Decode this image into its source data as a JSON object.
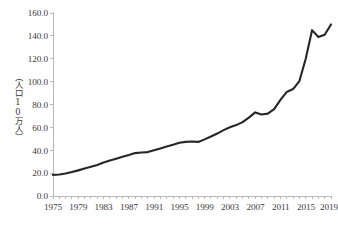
{
  "chart_data": {
    "type": "line",
    "title": "",
    "subtitle": "",
    "xlabel": "",
    "ylabel": "（人口10万人）",
    "ylabel_note": "per 100,000 population",
    "xlim": [
      1975,
      2019
    ],
    "ylim": [
      0.0,
      160.0
    ],
    "ytick_step": 20.0,
    "grid": false,
    "legend": "none",
    "x_tick_label_interval": 4,
    "x_minor_ticks_every": 1,
    "y_tick_labels": [
      "160.0",
      "140.0",
      "120.0",
      "100.0",
      "80.0",
      "60.0",
      "40.0",
      "20.0",
      "0.0"
    ],
    "y_tick_values": [
      160.0,
      140.0,
      120.0,
      100.0,
      80.0,
      60.0,
      40.0,
      20.0,
      0.0
    ],
    "x_tick_labels": [
      "1975",
      "1979",
      "1983",
      "1987",
      "1991",
      "1995",
      "1999",
      "2003",
      "2007",
      "2011",
      "2015",
      "2019"
    ],
    "x_tick_values": [
      1975,
      1979,
      1983,
      1987,
      1991,
      1995,
      1999,
      2003,
      2007,
      2011,
      2015,
      2019
    ],
    "series": [
      {
        "name": "rate",
        "color": "#262626",
        "x": [
          1975,
          1976,
          1977,
          1978,
          1979,
          1980,
          1981,
          1982,
          1983,
          1984,
          1985,
          1986,
          1987,
          1988,
          1989,
          1990,
          1991,
          1992,
          1993,
          1994,
          1995,
          1996,
          1997,
          1998,
          1999,
          2000,
          2001,
          2002,
          2003,
          2004,
          2005,
          2006,
          2007,
          2008,
          2009,
          2010,
          2011,
          2012,
          2013,
          2014,
          2015,
          2016,
          2017,
          2018,
          2019
        ],
        "values": [
          18.5,
          18.8,
          19.6,
          21.0,
          22.4,
          24.0,
          25.6,
          27.2,
          29.2,
          31.0,
          32.6,
          34.3,
          35.8,
          37.5,
          38.0,
          38.4,
          40.0,
          41.6,
          43.3,
          44.8,
          46.5,
          47.3,
          47.6,
          47.3,
          49.5,
          52.0,
          54.6,
          57.6,
          60.1,
          62.0,
          64.6,
          68.5,
          73.1,
          71.2,
          72.0,
          76.0,
          84.0,
          91.0,
          93.5,
          100.5,
          108.0,
          114.5,
          120.0,
          132.0,
          145.0
        ]
      }
    ],
    "annotations": [
      {
        "label": "local peak",
        "x": 2007,
        "y": 73.1
      },
      {
        "label": "dip",
        "x": 2008,
        "y": 71.2
      },
      {
        "label": "peak",
        "x": 2016,
        "y": 145.0
      },
      {
        "label": "dip",
        "x": 2017,
        "y": 139.0
      },
      {
        "label": "end",
        "x": 2019,
        "y": 150.0
      }
    ],
    "tail_override": {
      "note": "rendered path follows traced pixels including 2016 peak, 2017 dip, 2019 end",
      "points": [
        [
          2015,
          120.0
        ],
        [
          2016,
          145.0
        ],
        [
          2017,
          139.0
        ],
        [
          2018,
          141.0
        ],
        [
          2019,
          150.0
        ]
      ]
    },
    "colors": {
      "line": "#262626",
      "axis": "#b9b9b9",
      "text": "#3a3a3a",
      "background": "#ffffff"
    }
  },
  "plot_geometry": {
    "left": 53,
    "right": 331,
    "top": 13,
    "bottom": 196
  }
}
